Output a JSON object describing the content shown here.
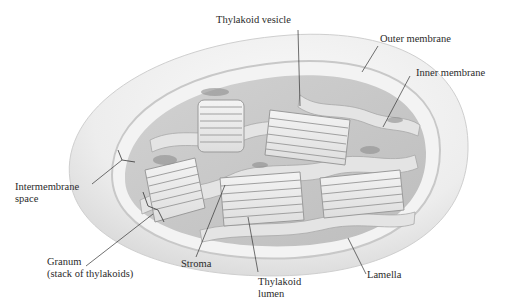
{
  "figure": {
    "style": "grayscale cutaway illustration",
    "colors": {
      "background": "#ffffff",
      "outer_membrane": "#e9e9e9",
      "intermembrane": "#f6f6f6",
      "inner_membrane": "#dcdcdc",
      "stroma": "#cfcfcf",
      "thylakoid": "#ececec",
      "thylakoid_edge": "#9a9a9a",
      "shadow": "#8c8c8c",
      "leader_line": "#333333",
      "label_text": "#2b2b2b"
    }
  },
  "labels": {
    "thylakoid_vesicle": "Thylakoid vesicle",
    "outer_membrane": "Outer membrane",
    "inner_membrane": "Inner membrane",
    "intermembrane_space": {
      "line1": "Intermembrane",
      "line2": "space"
    },
    "granum": {
      "line1": "Granum",
      "line2": "(stack of thylakoids)"
    },
    "stroma": "Stroma",
    "thylakoid_lumen": {
      "line1": "Thylakoid",
      "line2": "lumen"
    },
    "lamella": "Lamella"
  }
}
